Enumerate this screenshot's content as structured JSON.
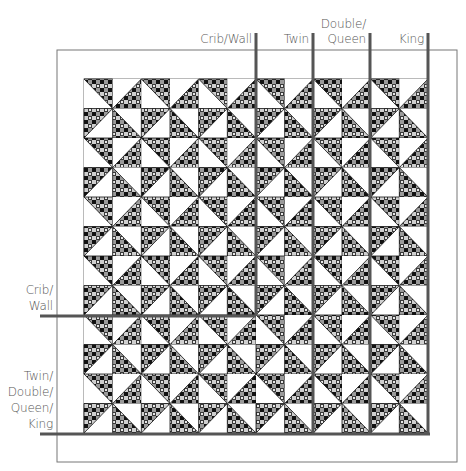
{
  "diagram": {
    "outer_border": {
      "x": 57,
      "y": 50,
      "w": 400,
      "h": 412
    },
    "inner_border": {
      "x": 84,
      "y": 79,
      "w": 344,
      "h": 354
    },
    "quadrant_grid": {
      "cols": 12,
      "rows": 12
    },
    "block_pattern": "pinwheel",
    "colors": {
      "line": "#555555",
      "border": "#777777",
      "dark_fabric": "#2a2a2a",
      "light_fabric": "#ffffff",
      "check_a": "#8a8a8a",
      "check_b": "#cfcfcf",
      "check_c": "#0d0d0d"
    }
  },
  "top_labels": [
    {
      "text": "Crib/Wall",
      "lines": [
        "Crib/Wall"
      ],
      "line_x": 256,
      "line_y_end": 316
    },
    {
      "text": "Twin",
      "lines": [
        "Twin"
      ],
      "line_x": 313,
      "line_y_end": 434
    },
    {
      "text": "Double/ Queen",
      "lines": [
        "Double/",
        "Queen"
      ],
      "line_x": 370,
      "line_y_end": 434
    },
    {
      "text": "King",
      "lines": [
        "King"
      ],
      "line_x": 428,
      "line_y_end": 434
    }
  ],
  "left_labels": [
    {
      "text": "Crib/ Wall",
      "lines": [
        "Crib/",
        "Wall"
      ],
      "line_y": 316,
      "line_x_end": 256
    },
    {
      "text": "Twin/ Double/ Queen/ King",
      "lines": [
        "Twin/",
        "Double/",
        "Queen/",
        "King"
      ],
      "line_y": 434,
      "line_x_end": 430
    }
  ]
}
